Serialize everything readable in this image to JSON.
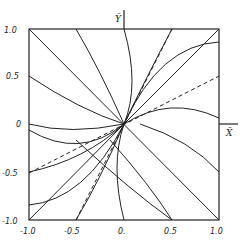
{
  "figure": {
    "type": "phase-portrait",
    "axes": {
      "x_label": "X̄",
      "y_label": "Ȳ",
      "x_ticks": [
        "-1.0",
        "-0.5",
        "0.",
        "0.5",
        "1.0"
      ],
      "y_ticks": [
        "1.0",
        "0.5",
        "0",
        "-0.5",
        "-1.0"
      ],
      "range": [
        -1.0,
        1.0
      ]
    },
    "frame": {
      "left": 29,
      "top": 29,
      "right": 219,
      "bottom": 220
    },
    "trajectories_solid": [
      [
        [
          -1.0,
          1.0
        ],
        [
          1.0,
          -1.0
        ]
      ],
      [
        [
          -0.5,
          1.0
        ],
        [
          -0.25,
          0.55
        ],
        [
          0.0,
          0.0
        ]
      ],
      [
        [
          -1.0,
          0.5
        ],
        [
          -0.5,
          0.15
        ],
        [
          0.0,
          0.0
        ]
      ],
      [
        [
          0.0,
          1.0
        ],
        [
          0.1,
          0.5
        ],
        [
          0.0,
          0.0
        ]
      ],
      [
        [
          0.5,
          1.0
        ],
        [
          0.3,
          0.45
        ],
        [
          0.0,
          0.0
        ]
      ],
      [
        [
          1.0,
          1.0
        ],
        [
          0.0,
          0.0
        ]
      ],
      [
        [
          1.0,
          0.55
        ],
        [
          0.4,
          0.45
        ],
        [
          0.0,
          0.0
        ]
      ],
      [
        [
          1.0,
          0.05
        ],
        [
          0.5,
          0.15
        ],
        [
          0.0,
          0.0
        ]
      ],
      [
        [
          -1.0,
          -1.0
        ],
        [
          0.0,
          0.0
        ]
      ],
      [
        [
          -1.0,
          -0.55
        ],
        [
          -0.4,
          -0.45
        ],
        [
          0.0,
          0.0
        ]
      ],
      [
        [
          -1.0,
          -0.05
        ],
        [
          -0.5,
          -0.15
        ],
        [
          0.0,
          0.0
        ]
      ],
      [
        [
          0.0,
          -1.0
        ],
        [
          -0.1,
          -0.5
        ],
        [
          0.0,
          0.0
        ]
      ],
      [
        [
          -0.5,
          -1.0
        ],
        [
          -0.3,
          -0.45
        ],
        [
          0.0,
          0.0
        ]
      ],
      [
        [
          0.5,
          -1.0
        ],
        [
          0.25,
          -0.55
        ],
        [
          0.0,
          0.0
        ]
      ],
      [
        [
          1.0,
          -0.5
        ],
        [
          0.5,
          -0.15
        ],
        [
          0.0,
          0.0
        ]
      ],
      [
        [
          0.0,
          1.0
        ],
        [
          0.45,
          0.3
        ],
        [
          1.0,
          -0.5
        ]
      ]
    ],
    "separatrices_dashed": [
      [
        [
          -0.5,
          -1.0
        ],
        [
          0.5,
          1.0
        ]
      ],
      [
        [
          -1.0,
          -0.55
        ],
        [
          1.0,
          0.55
        ]
      ]
    ]
  }
}
